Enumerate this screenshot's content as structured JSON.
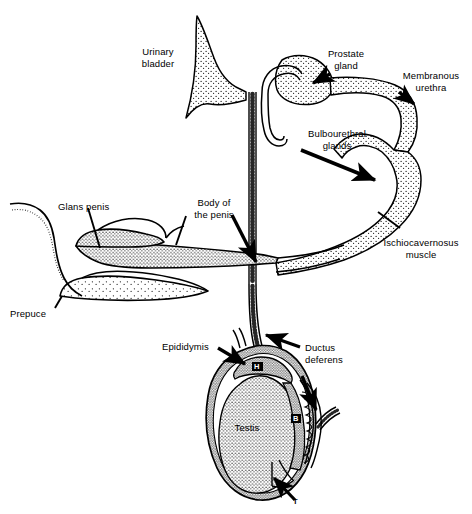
{
  "figure": {
    "background_color": "#ffffff",
    "ink_color": "#000000",
    "width": 472,
    "height": 514
  },
  "labels": {
    "urinary_bladder": "Urinary\nbladder",
    "prostate_gland": "Prostate\ngland",
    "membranous_urethra": "Membranous\nurethra",
    "bulbourethral_glands": "Bulbourethral\nglands",
    "ischiocavernosus_muscle": "Ischiocavernosus\nmuscle",
    "glans_penis": "Glans penis",
    "body_of_the_penis": "Body of\nthe penis",
    "prepuce": "Prepuce",
    "epididymis": "Epididymis",
    "ductus_deferens": "Ductus\ndeferens",
    "testis": "Testis"
  },
  "markers": {
    "head_of_epididymis": "H",
    "body_of_epididymis": "B",
    "tail_of_epididymis": "T"
  },
  "structures": [
    "urinary bladder",
    "prostate gland",
    "membranous urethra",
    "bulbourethral glands",
    "ischiocavernosus muscle",
    "body of the penis",
    "glans penis",
    "prepuce",
    "ductus deferens",
    "epididymis",
    "testis",
    "scrotum"
  ]
}
